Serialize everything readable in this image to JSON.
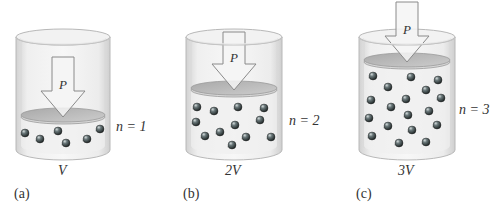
{
  "figure": {
    "panels": [
      {
        "id": "a",
        "panel_label": "(a)",
        "volume_label": "V",
        "moles_label": "n = 1",
        "pressure_label": "P",
        "molecule_count": 6,
        "cx": 63,
        "rx": 47,
        "top_y": 37,
        "bottom_y": 150,
        "piston_y": 115,
        "arrow_top": 57,
        "molecules": [
          [
            25,
            133
          ],
          [
            40,
            139
          ],
          [
            58,
            131
          ],
          [
            66,
            143
          ],
          [
            87,
            139
          ],
          [
            100,
            129
          ]
        ]
      },
      {
        "id": "b",
        "panel_label": "(b)",
        "volume_label": "2V",
        "moles_label": "n = 2",
        "pressure_label": "P",
        "molecule_count": 12,
        "cx": 234,
        "rx": 48,
        "top_y": 37,
        "bottom_y": 150,
        "piston_y": 88,
        "arrow_top": 32,
        "molecules": [
          [
            197,
            107
          ],
          [
            214,
            111
          ],
          [
            238,
            107
          ],
          [
            264,
            108
          ],
          [
            196,
            122
          ],
          [
            235,
            125
          ],
          [
            260,
            120
          ],
          [
            205,
            136
          ],
          [
            220,
            132
          ],
          [
            246,
            137
          ],
          [
            271,
            137
          ],
          [
            232,
            145
          ]
        ]
      },
      {
        "id": "c",
        "panel_label": "(c)",
        "volume_label": "3V",
        "moles_label": "n = 3",
        "pressure_label": "P",
        "molecule_count": 18,
        "cx": 407,
        "rx": 48,
        "top_y": 37,
        "bottom_y": 150,
        "piston_y": 60,
        "arrow_top": 2,
        "molecules": [
          [
            373,
            76
          ],
          [
            411,
            77
          ],
          [
            438,
            80
          ],
          [
            388,
            87
          ],
          [
            426,
            90
          ],
          [
            371,
            100
          ],
          [
            406,
            99
          ],
          [
            441,
            98
          ],
          [
            391,
            107
          ],
          [
            429,
            111
          ],
          [
            369,
            118
          ],
          [
            408,
            115
          ],
          [
            388,
            126
          ],
          [
            437,
            125
          ],
          [
            412,
            130
          ],
          [
            372,
            136
          ],
          [
            399,
            143
          ],
          [
            426,
            142
          ]
        ]
      }
    ],
    "colors": {
      "glass": "#e4e4e4",
      "glass_edge": "#b8b8b8",
      "piston": "#bdbdbd",
      "piston_edge": "#9a9a9a",
      "arrow_fill": "#f4f4f4",
      "arrow_stroke": "#8a8a8a",
      "molecule": "#3d4a4c",
      "text": "#333333"
    }
  }
}
